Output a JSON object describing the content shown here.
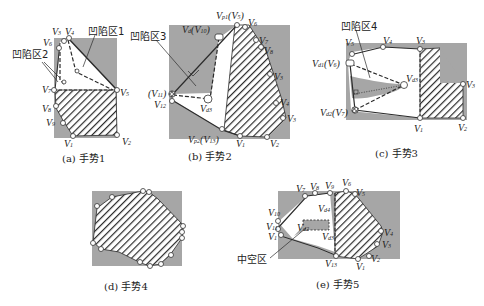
{
  "colors": {
    "background_rect": "#a6a6a6",
    "hatch": "#2b2b2b",
    "line": "#2b2b2b",
    "vertex_fill": "#ffffff"
  },
  "panels": [
    {
      "id": "a",
      "caption": "(a) 手势1",
      "annotations": [
        "凹陷区1",
        "凹陷区2"
      ],
      "vertex_labels": [
        "V3",
        "V4",
        "V6",
        "V7",
        "V5",
        "V8",
        "V9",
        "V1",
        "V2"
      ]
    },
    {
      "id": "b",
      "caption": "(b) 手势2",
      "annotations": [
        "凹陷区3"
      ],
      "vertex_labels": [
        "Vp1(V5)",
        "V6",
        "Vd(V10)",
        "V7",
        "V8",
        "V3",
        "V4",
        "V3",
        "V11",
        "V12",
        "Vd3",
        "Vp2(V13)",
        "V1",
        "V2"
      ]
    },
    {
      "id": "c",
      "caption": "(c) 手势3",
      "annotations": [
        "凹陷区4"
      ],
      "vertex_labels": [
        "V5",
        "V4",
        "V3",
        "Vd1(V6)",
        "Vd3",
        "Vd2(V7)",
        "V1",
        "V2",
        "V3"
      ]
    },
    {
      "id": "d",
      "caption": "(d) 手势4",
      "annotations": [],
      "vertex_labels": []
    },
    {
      "id": "e",
      "caption": "(e) 手势5",
      "annotations": [
        "中空区"
      ],
      "vertex_labels": [
        "V7",
        "V8",
        "V9",
        "V6",
        "V5",
        "V10",
        "V11",
        "V1",
        "Vd4",
        "Vd2",
        "Vd3",
        "V13",
        "V4",
        "V3",
        "V1",
        "V2"
      ]
    }
  ]
}
